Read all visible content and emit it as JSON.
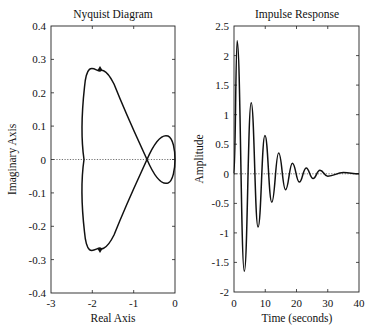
{
  "chart_data": [
    {
      "type": "line",
      "title": "Nyquist Diagram",
      "xlabel": "Real Axis",
      "ylabel": "Imaginary Axis",
      "xlim": [
        -3,
        0
      ],
      "ylim": [
        -0.4,
        0.4
      ],
      "xticks": [
        "-3",
        "-2",
        "-1",
        "0"
      ],
      "yticks": [
        "0.4",
        "0.3",
        "0.2",
        "0.1",
        "0",
        "-0.1",
        "-0.2",
        "-0.3",
        "-0.4"
      ],
      "grid": false,
      "zero_line": "dotted",
      "series": [
        {
          "name": "Nyquist (positive frequency)",
          "points": [
            [
              0,
              0
            ],
            [
              -0.02,
              0.04
            ],
            [
              -0.1,
              0.065
            ],
            [
              -0.25,
              0.07
            ],
            [
              -0.45,
              0.03
            ],
            [
              -0.7,
              0.0
            ],
            [
              -1.0,
              -0.08
            ],
            [
              -1.3,
              -0.19
            ],
            [
              -1.55,
              -0.25
            ],
            [
              -1.8,
              -0.265
            ],
            [
              -2.0,
              -0.22
            ],
            [
              -2.15,
              -0.12
            ],
            [
              -2.2,
              0.0
            ]
          ]
        },
        {
          "name": "Nyquist (negative frequency)",
          "points": [
            [
              -2.2,
              0.0
            ],
            [
              -2.15,
              0.12
            ],
            [
              -2.0,
              0.22
            ],
            [
              -1.8,
              0.265
            ],
            [
              -1.55,
              0.25
            ],
            [
              -1.3,
              0.19
            ],
            [
              -1.0,
              0.08
            ],
            [
              -0.7,
              0.0
            ],
            [
              -0.45,
              -0.03
            ],
            [
              -0.25,
              -0.07
            ],
            [
              -0.1,
              -0.065
            ],
            [
              -0.02,
              -0.04
            ],
            [
              0,
              0
            ]
          ]
        }
      ],
      "annotations": [
        "arrow at (-1.8, 0.265)",
        "arrow at (-1.8, -0.265)"
      ]
    },
    {
      "type": "line",
      "title": "Impulse Response",
      "xlabel": "Time (seconds)",
      "ylabel": "Amplitude",
      "xlim": [
        0,
        40
      ],
      "ylim": [
        -2,
        2.5
      ],
      "xticks": [
        "0",
        "10",
        "20",
        "30",
        "40"
      ],
      "yticks": [
        "2.5",
        "2",
        "1.5",
        "1",
        "0.5",
        "0",
        "-0.5",
        "-1",
        "-1.5",
        "-2"
      ],
      "grid": false,
      "zero_line": "dotted",
      "series": [
        {
          "name": "Impulse response",
          "peaks": [
            [
              1.0,
              2.25
            ],
            [
              3.3,
              -1.65
            ],
            [
              5.5,
              1.2
            ],
            [
              7.7,
              -0.9
            ],
            [
              9.9,
              0.65
            ],
            [
              12.1,
              -0.48
            ],
            [
              14.3,
              0.35
            ],
            [
              16.5,
              -0.27
            ],
            [
              18.7,
              0.18
            ],
            [
              20.9,
              -0.14
            ],
            [
              23.1,
              0.1
            ],
            [
              25.3,
              -0.08
            ],
            [
              27.5,
              0.06
            ],
            [
              30,
              -0.04
            ],
            [
              35,
              0.02
            ],
            [
              40,
              0.0
            ]
          ]
        }
      ]
    }
  ],
  "left": {
    "title": "Nyquist Diagram",
    "xlabel": "Real Axis",
    "ylabel": "Imaginary Axis",
    "xticks": [
      "-3",
      "-2",
      "-1",
      "0"
    ],
    "yticks": [
      "0.4",
      "0.3",
      "0.2",
      "0.1",
      "0",
      "-0.1",
      "-0.2",
      "-0.3",
      "-0.4"
    ]
  },
  "right": {
    "title": "Impulse Response",
    "xlabel": "Time (seconds)",
    "ylabel": "Amplitude",
    "xticks": [
      "0",
      "10",
      "20",
      "30",
      "40"
    ],
    "yticks": [
      "2.5",
      "2",
      "1.5",
      "1",
      "0.5",
      "0",
      "-0.5",
      "-1",
      "-1.5",
      "-2"
    ]
  }
}
